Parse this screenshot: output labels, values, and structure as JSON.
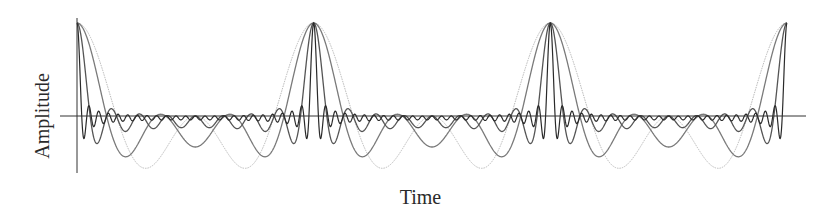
{
  "chart_data": {
    "type": "line",
    "title": "",
    "xlabel": "Time",
    "ylabel": "Amplitude",
    "grid": false,
    "legend": null,
    "ticks": {
      "x": [],
      "y": []
    },
    "periods_shown": 3,
    "xlim": [
      0,
      3
    ],
    "ylim": [
      -0.62,
      1.0
    ],
    "peak_positions": [
      0,
      1,
      2,
      3
    ],
    "peak_value": 1.0,
    "series": [
      {
        "name": "2 harmonics",
        "harmonics": 2,
        "color": "#b8b8b8",
        "width": 1.0,
        "dash": "1.5,1",
        "min_value": -0.56
      },
      {
        "name": "3 harmonics",
        "harmonics": 3,
        "color": "#7a7a7a",
        "width": 1.3,
        "dash": "",
        "min_value": -0.42
      },
      {
        "name": "8 harmonics",
        "harmonics": 8,
        "color": "#555555",
        "width": 1.3,
        "dash": "",
        "min_value": -0.22
      },
      {
        "name": "24 harmonics",
        "harmonics": 24,
        "color": "#2a2a2a",
        "width": 1.2,
        "dash": "",
        "min_value": -0.22
      }
    ]
  },
  "layout": {
    "x_axis_y": 116,
    "x_axis_from": 60,
    "x_axis_to": 806,
    "y_axis_x": 77,
    "y_axis_from": 18,
    "y_axis_to": 173,
    "plot_x0": 77,
    "plot_x1": 787,
    "peak_y": 23,
    "axis_color": "#333333"
  }
}
